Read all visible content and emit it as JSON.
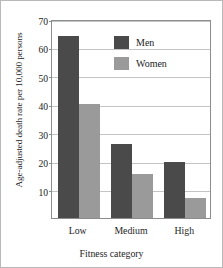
{
  "chart_data": {
    "type": "bar",
    "title": "",
    "xlabel": "Fitness category",
    "ylabel": "Age-adjusted death rate per 10,000 persons",
    "categories": [
      "Low",
      "Medium",
      "High"
    ],
    "series": [
      {
        "name": "Men",
        "color": "#4a4a4a",
        "values": [
          64,
          26,
          19.7
        ]
      },
      {
        "name": "Women",
        "color": "#9a9a9a",
        "values": [
          40,
          15.5,
          7
        ]
      }
    ],
    "ylim": [
      0,
      70
    ],
    "yticks": [
      10,
      20,
      30,
      40,
      50,
      60,
      70
    ],
    "ytick_labels": [
      "10",
      "20",
      "30",
      "40",
      "50",
      "60",
      "70"
    ],
    "grid": "horizontal",
    "legend_position": "top-center-inside",
    "legend_border": false
  },
  "figure": {
    "border_color": "#b9b9b9",
    "background": "#ffffff",
    "axis_color": "#8d8d8d",
    "gridline_color": "#c4c4c4"
  }
}
